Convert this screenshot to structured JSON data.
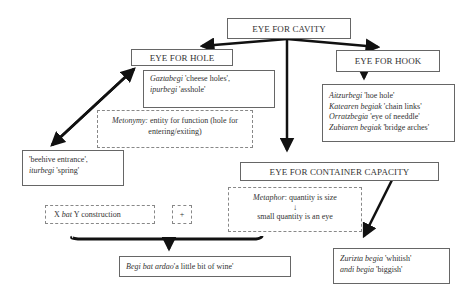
{
  "nodes": {
    "cavity": {
      "title": "EYE FOR CAVITY"
    },
    "hole": {
      "title": "EYE FOR HOLE"
    },
    "hook": {
      "title": "EYE FOR HOOK"
    },
    "container": {
      "title": "EYE FOR CONTAINER CAPACITY"
    }
  },
  "hole_examples": {
    "l1_term": "Gaztabegi",
    "l1_gloss": " 'cheese holes',",
    "l2_term": "ipurbegi",
    "l2_gloss": " 'asshole'"
  },
  "metonymy": {
    "label": "Metonymy:",
    "text": " entity for function (hole for",
    "text2": "entering/exiting)"
  },
  "beehive": {
    "l1": "'beehive entrance',",
    "l2_term": "iturbegi",
    "l2_gloss": "  'spring'"
  },
  "hook_examples": [
    {
      "term": "Aitzurbegi",
      "gloss": " 'hoe hole'"
    },
    {
      "term": "Katearen begiak",
      "gloss": " 'chain links'"
    },
    {
      "term": "Orratzbegia",
      "gloss": " 'eye of needdle'"
    },
    {
      "term": "Zubiaren begiak",
      "gloss": " 'bridge arches'"
    }
  ],
  "metaphor": {
    "label": "Metaphor",
    "text": ": quantity is size",
    "arrow": "↓",
    "text2": "small quantity is an eye"
  },
  "construction": {
    "x": "X ",
    "bat": "bat",
    "rest": " Y construction",
    "plus": "+"
  },
  "wine": {
    "term": "Begi bat ardao",
    "gloss": "'a little bit of wine'"
  },
  "size": {
    "l1_term": "Zurizta begia",
    "l1_gloss": " 'whitish'",
    "l2_term": "andi begia",
    "l2_gloss": " 'biggish'"
  }
}
